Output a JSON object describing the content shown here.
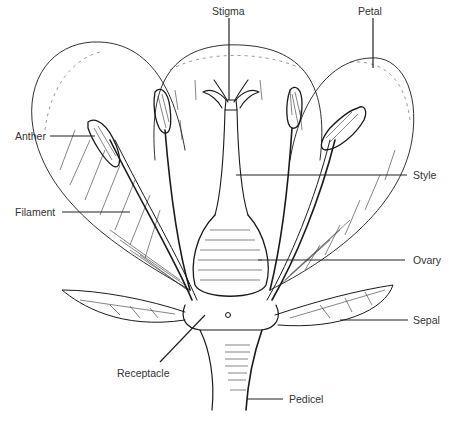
{
  "diagram": {
    "labels": {
      "stigma": "Stigma",
      "petal": "Petal",
      "anther": "Anther",
      "style": "Style",
      "filament": "Filament",
      "ovary": "Ovary",
      "sepal": "Sepal",
      "receptacle": "Receptacle",
      "pedicel": "Pedicel"
    },
    "colors": {
      "ink": "#1a1a1a",
      "label_text": "#333333",
      "background": "#ffffff"
    }
  }
}
